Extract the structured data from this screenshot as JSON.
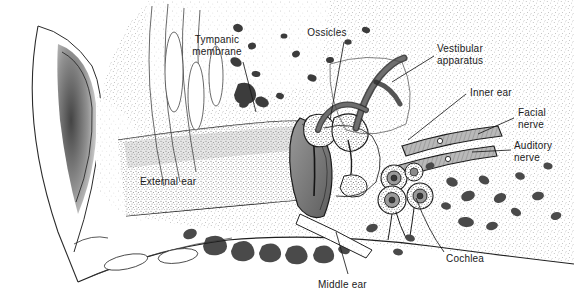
{
  "figure": {
    "type": "anatomical-illustration",
    "style": "pen-and-ink stipple engraving, grayscale",
    "background_color": "#ffffff",
    "ink_color": "#1a1a1a",
    "width": 574,
    "height": 301
  },
  "labels": [
    {
      "id": "tympanic-membrane",
      "text": "Tympanic\nmembrane",
      "x": 215,
      "y": 36,
      "align": "center",
      "leader": "M 243 62 L 256 112"
    },
    {
      "id": "ossicles",
      "text": "Ossicles",
      "x": 327,
      "y": 28,
      "align": "center",
      "leader": "M 344 42 L 330 120"
    },
    {
      "id": "vestibular-apparatus",
      "text": "Vestibular\napparatus",
      "x": 437,
      "y": 44,
      "align": "left",
      "leader": "M 434 56 L 392 82"
    },
    {
      "id": "inner-ear",
      "text": "Inner ear",
      "x": 470,
      "y": 88,
      "align": "left",
      "leader": "M 466 94 L 408 140"
    },
    {
      "id": "facial-nerve",
      "text": "Facial\nnerve",
      "x": 518,
      "y": 108,
      "align": "left",
      "leader": "M 514 118 L 478 134"
    },
    {
      "id": "auditory-nerve",
      "text": "Auditory\nnerve",
      "x": 514,
      "y": 141,
      "align": "left",
      "leader": "M 511 150 L 472 152"
    },
    {
      "id": "external-ear",
      "text": "External ear",
      "x": 140,
      "y": 177,
      "align": "left",
      "leader": ""
    },
    {
      "id": "cochlea",
      "text": "Cochlea",
      "x": 446,
      "y": 255,
      "align": "left",
      "leader": "M 444 256 Q 428 232 416 196"
    },
    {
      "id": "middle-ear",
      "text": "Middle ear",
      "x": 318,
      "y": 281,
      "align": "left",
      "leader": "M 348 276 L 336 232"
    }
  ],
  "structures": [
    {
      "id": "pinna-canal",
      "name": "External auditory canal / pinna"
    },
    {
      "id": "mastoid-air-cells",
      "name": "Mastoid air cells"
    },
    {
      "id": "tympanic-membrane",
      "name": "Tympanic membrane (eardrum)"
    },
    {
      "id": "ossicles",
      "name": "Ossicles (malleus, incus, stapes)"
    },
    {
      "id": "vestibular-apparatus",
      "name": "Semicircular canals"
    },
    {
      "id": "cochlea",
      "name": "Cochlea spiral cross-sections"
    },
    {
      "id": "facial-nerve",
      "name": "Facial nerve bundle"
    },
    {
      "id": "auditory-nerve",
      "name": "Auditory nerve bundle"
    },
    {
      "id": "temporal-bone",
      "name": "Temporal bone, stippled"
    }
  ]
}
